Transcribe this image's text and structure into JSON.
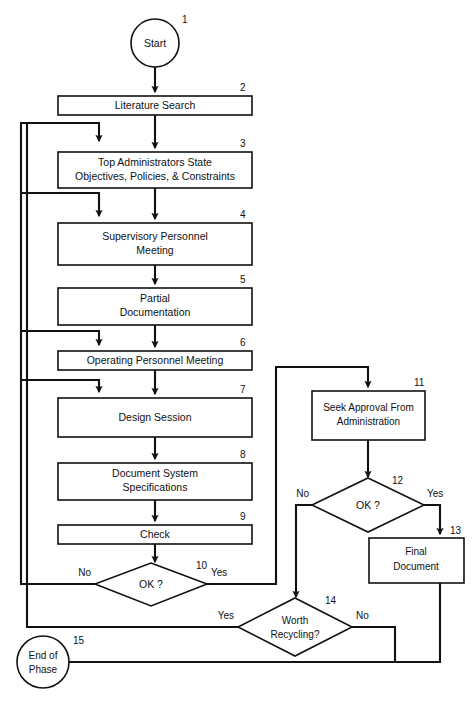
{
  "diagram": {
    "type": "flowchart",
    "colors": {
      "background": "#ffffff",
      "stroke": "#111111",
      "fill": "#ffffff"
    },
    "nodes": [
      {
        "id": "1",
        "number": "1",
        "shape": "circle",
        "lines": [
          "Start"
        ]
      },
      {
        "id": "2",
        "number": "2",
        "shape": "box",
        "lines": [
          "Literature Search"
        ]
      },
      {
        "id": "3",
        "number": "3",
        "shape": "box",
        "lines": [
          "Top Administrators State",
          "Objectives, Policies, & Constraints"
        ]
      },
      {
        "id": "4",
        "number": "4",
        "shape": "box",
        "lines": [
          "Supervisory Personnel",
          "Meeting"
        ]
      },
      {
        "id": "5",
        "number": "5",
        "shape": "box",
        "lines": [
          "Partial",
          "Documentation"
        ]
      },
      {
        "id": "6",
        "number": "6",
        "shape": "box",
        "lines": [
          "Operating Personnel Meeting"
        ]
      },
      {
        "id": "7",
        "number": "7",
        "shape": "box",
        "lines": [
          "Design Session"
        ]
      },
      {
        "id": "8",
        "number": "8",
        "shape": "box",
        "lines": [
          "Document System",
          "Specifications"
        ]
      },
      {
        "id": "9",
        "number": "9",
        "shape": "box",
        "lines": [
          "Check"
        ]
      },
      {
        "id": "10",
        "number": "10",
        "shape": "diamond",
        "lines": [
          "OK ?"
        ]
      },
      {
        "id": "11",
        "number": "11",
        "shape": "box",
        "lines": [
          "Seek Approval From",
          "Administration"
        ]
      },
      {
        "id": "12",
        "number": "12",
        "shape": "diamond",
        "lines": [
          "OK ?"
        ]
      },
      {
        "id": "13",
        "number": "13",
        "shape": "box",
        "lines": [
          "Final",
          "Document"
        ]
      },
      {
        "id": "14",
        "number": "14",
        "shape": "diamond",
        "lines": [
          "Worth",
          "Recycling?"
        ]
      },
      {
        "id": "15",
        "number": "15",
        "shape": "circle",
        "lines": [
          "End of",
          "Phase"
        ]
      }
    ],
    "branch_labels": {
      "d10_no": "No",
      "d10_yes": "Yes",
      "d12_no": "No",
      "d12_yes": "Yes",
      "d14_yes": "Yes",
      "d14_no": "No"
    }
  }
}
